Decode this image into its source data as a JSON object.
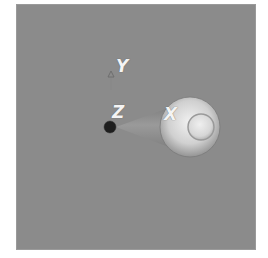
{
  "viewport": {
    "background": "#8b8b8b",
    "gizmo": {
      "axes": [
        {
          "name": "X",
          "label": "X"
        },
        {
          "name": "Y",
          "label": "Y"
        },
        {
          "name": "Z",
          "label": "Z"
        }
      ]
    }
  }
}
